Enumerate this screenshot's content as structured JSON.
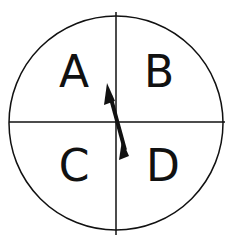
{
  "spinner": {
    "sections": [
      {
        "label": "A",
        "quadrant": "top-left"
      },
      {
        "label": "B",
        "quadrant": "top-right"
      },
      {
        "label": "C",
        "quadrant": "bottom-left"
      },
      {
        "label": "D",
        "quadrant": "bottom-right"
      }
    ],
    "pointer": {
      "points_to": "A"
    },
    "colors": {
      "stroke": "#111111",
      "background": "#ffffff"
    }
  }
}
